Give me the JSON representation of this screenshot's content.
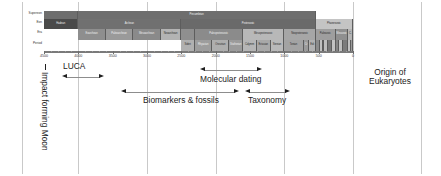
{
  "figure": {
    "type": "geological-timescale-annotated",
    "axis_unit": "Ma",
    "direction": "oldest-left"
  },
  "chart_data": {
    "type": "bar",
    "title": "",
    "xlabel": "",
    "ylabel": "",
    "xlim": [
      4500,
      0
    ],
    "grid": true,
    "legend": false,
    "tick_labels": [
      "4500",
      "4000",
      "3500",
      "3000",
      "2500",
      "2000",
      "1500",
      "1000",
      "500",
      "0"
    ],
    "tick_values": [
      4500,
      4000,
      3500,
      3000,
      2500,
      2000,
      1500,
      1000,
      500,
      0
    ],
    "row_labels": [
      "Supereon",
      "Eon",
      "Era",
      "Period"
    ],
    "rows": [
      {
        "name": "Supereon",
        "cells": [
          {
            "label": "",
            "start": 4560,
            "end": 4000,
            "fill": "#6e6e6e",
            "tone": "dark"
          },
          {
            "label": "Precambrian",
            "start": 4000,
            "end": 541,
            "fill": "#6e6e6e",
            "tone": "dark"
          },
          {
            "label": "",
            "start": 541,
            "end": 0,
            "fill": "none",
            "tone": "light"
          }
        ]
      },
      {
        "name": "Eon",
        "cells": [
          {
            "label": "Hadean",
            "start": 4560,
            "end": 4000,
            "fill": "#4a4a4a",
            "tone": "dark"
          },
          {
            "label": "Archean",
            "start": 4000,
            "end": 2500,
            "fill": "#707070",
            "tone": "dark"
          },
          {
            "label": "Proterozoic",
            "start": 2500,
            "end": 541,
            "fill": "#6a6a6a",
            "tone": "dark"
          },
          {
            "label": "Phanerozoic",
            "start": 541,
            "end": 0,
            "fill": "#c4c4c4",
            "tone": "light"
          }
        ]
      },
      {
        "name": "Era",
        "cells": [
          {
            "label": "",
            "start": 4560,
            "end": 4000,
            "fill": "none",
            "tone": "light"
          },
          {
            "label": "Eoarchean",
            "start": 4000,
            "end": 3600,
            "fill": "#8e8e8e",
            "tone": "dark"
          },
          {
            "label": "Paleoarchean",
            "start": 3600,
            "end": 3200,
            "fill": "#9a9a9a",
            "tone": "dark"
          },
          {
            "label": "Mesoarchean",
            "start": 3200,
            "end": 2800,
            "fill": "#8a8a8a",
            "tone": "dark"
          },
          {
            "label": "Neoarchean",
            "start": 2800,
            "end": 2500,
            "fill": "#b3b3b3",
            "tone": "light"
          },
          {
            "label": "",
            "start": 2500,
            "end": 2300,
            "fill": "#8f8f8f",
            "tone": "dark"
          },
          {
            "label": "Paleoproterozoic",
            "start": 2300,
            "end": 1600,
            "fill": "#8b8b8b",
            "tone": "dark"
          },
          {
            "label": "Mesoproterozoic",
            "start": 1600,
            "end": 1000,
            "fill": "#b8b8b8",
            "tone": "light"
          },
          {
            "label": "Neoproterozoic",
            "start": 1000,
            "end": 541,
            "fill": "#a6a6a6",
            "tone": "light"
          },
          {
            "label": "Paleozoic",
            "start": 541,
            "end": 252,
            "fill": "#9e9e9e",
            "tone": "light"
          },
          {
            "label": "Mesozoic",
            "start": 252,
            "end": 66,
            "fill": "#8f8f8f",
            "tone": "dark"
          },
          {
            "label": "C.",
            "start": 66,
            "end": 0,
            "fill": "#b5b5b5",
            "tone": "light"
          }
        ]
      },
      {
        "name": "Period",
        "cells": [
          {
            "label": "",
            "start": 4560,
            "end": 4000,
            "fill": "none",
            "tone": "light"
          },
          {
            "label": "",
            "start": 4000,
            "end": 2500,
            "fill": "none",
            "tone": "light"
          },
          {
            "label": "Sideri",
            "start": 2500,
            "end": 2300,
            "fill": "#b0b0b0",
            "tone": "light"
          },
          {
            "label": "Rhyacian",
            "start": 2300,
            "end": 2050,
            "fill": "#9d9d9d",
            "tone": "dark"
          },
          {
            "label": "Orosirian",
            "start": 2050,
            "end": 1800,
            "fill": "#aeaeae",
            "tone": "light"
          },
          {
            "label": "Statherian",
            "start": 1800,
            "end": 1600,
            "fill": "#9b9b9b",
            "tone": "dark"
          },
          {
            "label": "Calymm",
            "start": 1600,
            "end": 1400,
            "fill": "#b6b6b6",
            "tone": "light"
          },
          {
            "label": "Ectasian",
            "start": 1400,
            "end": 1200,
            "fill": "#a8a8a8",
            "tone": "light"
          },
          {
            "label": "Stenian",
            "start": 1200,
            "end": 1000,
            "fill": "#b9b9b9",
            "tone": "light"
          },
          {
            "label": "Tonian",
            "start": 1000,
            "end": 720,
            "fill": "#a3a3a3",
            "tone": "light"
          },
          {
            "label": "Cr",
            "start": 720,
            "end": 635,
            "fill": "#9a9a9a",
            "tone": "dark"
          },
          {
            "label": "Edi",
            "start": 635,
            "end": 541,
            "fill": "#b2b2b2",
            "tone": "light"
          },
          {
            "label": "",
            "start": 541,
            "end": 485,
            "fill": "#8c8c8c",
            "tone": "dark"
          },
          {
            "label": "",
            "start": 485,
            "end": 444,
            "fill": "#c0c0c0",
            "tone": "light"
          },
          {
            "label": "",
            "start": 444,
            "end": 419,
            "fill": "#7e7e7e",
            "tone": "dark"
          },
          {
            "label": "",
            "start": 419,
            "end": 359,
            "fill": "#bdbdbd",
            "tone": "light"
          },
          {
            "label": "",
            "start": 359,
            "end": 299,
            "fill": "#777777",
            "tone": "dark"
          },
          {
            "label": "",
            "start": 299,
            "end": 252,
            "fill": "#c2c2c2",
            "tone": "light"
          },
          {
            "label": "",
            "start": 252,
            "end": 201,
            "fill": "#858585",
            "tone": "dark"
          },
          {
            "label": "",
            "start": 201,
            "end": 145,
            "fill": "#bfbfbf",
            "tone": "light"
          },
          {
            "label": "",
            "start": 145,
            "end": 66,
            "fill": "#7c7c7c",
            "tone": "dark"
          },
          {
            "label": "",
            "start": 66,
            "end": 23,
            "fill": "#c3c3c3",
            "tone": "light"
          },
          {
            "label": "",
            "start": 23,
            "end": 0,
            "fill": "#9c9c9c",
            "tone": "light"
          }
        ]
      }
    ],
    "annotations": [
      {
        "name": "impact-forming-moon",
        "text": "Impact forming Moon",
        "orientation": "vertical",
        "at": 4450
      },
      {
        "name": "luca",
        "text": "LUCA",
        "orientation": "horizontal",
        "range": [
          4250,
          3700
        ]
      },
      {
        "name": "molecular-dating",
        "text": "Molecular dating",
        "orientation": "horizontal",
        "range": [
          2300,
          1500
        ]
      },
      {
        "name": "biomarkers-fossils",
        "text": "Biomarkers & fossils",
        "orientation": "horizontal",
        "range": [
          3300,
          1650
        ]
      },
      {
        "name": "taxonomy",
        "text": "Taxonomy",
        "orientation": "horizontal",
        "range": [
          1550,
          1000
        ]
      },
      {
        "name": "origin-of-eukaryotes",
        "text": "Origin of Eukaryotes",
        "line1": "Origin of",
        "line2": "Eukaryotes",
        "orientation": "horizontal"
      }
    ]
  }
}
